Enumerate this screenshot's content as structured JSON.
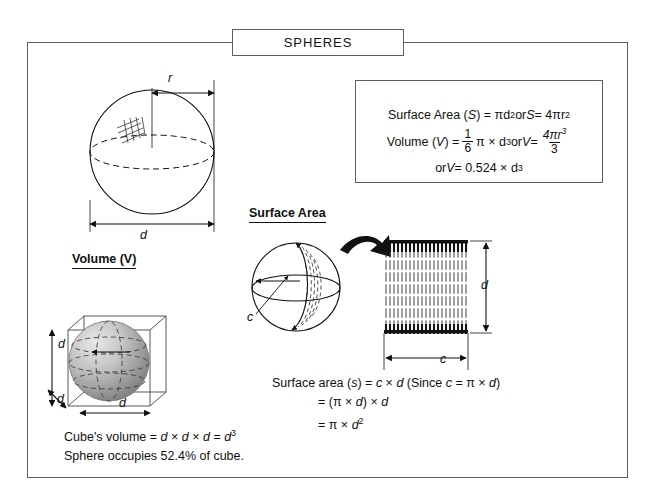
{
  "title": "SPHERES",
  "formula_box": {
    "line1": {
      "label": "Surface Area (",
      "sym": "S",
      "eq": ") = πd",
      "exp1": "2",
      "or": " or ",
      "sym2": "S",
      "rhs": " = 4πr",
      "exp2": "2"
    },
    "line2": {
      "label": "Volume (",
      "sym": "V",
      "eq": ") = ",
      "frac_num": "1",
      "frac_den": "6",
      "mid": "π × d",
      "exp1": "3",
      "or": " or ",
      "sym2": "V",
      "eq2": " = ",
      "frac2_num": "4πr",
      "frac2_num_exp": "3",
      "frac2_den": "3"
    },
    "line3": {
      "or": "or ",
      "sym": "V",
      "eq": " = 0.524 × d",
      "exp": "3"
    }
  },
  "sections": {
    "volume_heading": "Volume (V)",
    "surface_area_heading": "Surface Area"
  },
  "labels": {
    "radius": "r",
    "diameter": "d",
    "cube_height": "d",
    "cube_depth": "d",
    "cube_width": "d",
    "circumference": "c",
    "rect_height": "d",
    "rect_width": "c"
  },
  "surface_area_derivation": {
    "line1": "Surface area (s) = c × d (Since c = π × d)",
    "line1_parts": {
      "pre": "Surface area (",
      "s": "s",
      "mid": ") = ",
      "c": "c",
      "times": " × ",
      "d": "d",
      "since_open": " (Since ",
      "c2": "c",
      "eq": " = π × ",
      "d2": "d",
      "close": ")"
    },
    "line2_parts": {
      "eq": "= (π × ",
      "d": "d",
      "mid": ") × ",
      "d2": "d"
    },
    "line3_parts": {
      "eq": "= π × ",
      "d": "d",
      "exp": "2"
    }
  },
  "cube_notes": {
    "line1_parts": {
      "pre": "Cube's volume = ",
      "d1": "d",
      "t1": " × ",
      "d2": "d",
      "t2": " × ",
      "d3": "d",
      "eq": " = ",
      "d4": "d",
      "exp": "3"
    },
    "line2": "Sphere occupies 52.4% of cube."
  },
  "colors": {
    "frame": "#5a5f66",
    "ink": "#111111",
    "sphere_light": "#e6e6e6",
    "sphere_dark": "#8c8c8c",
    "hatch": "#2b2b2b"
  }
}
